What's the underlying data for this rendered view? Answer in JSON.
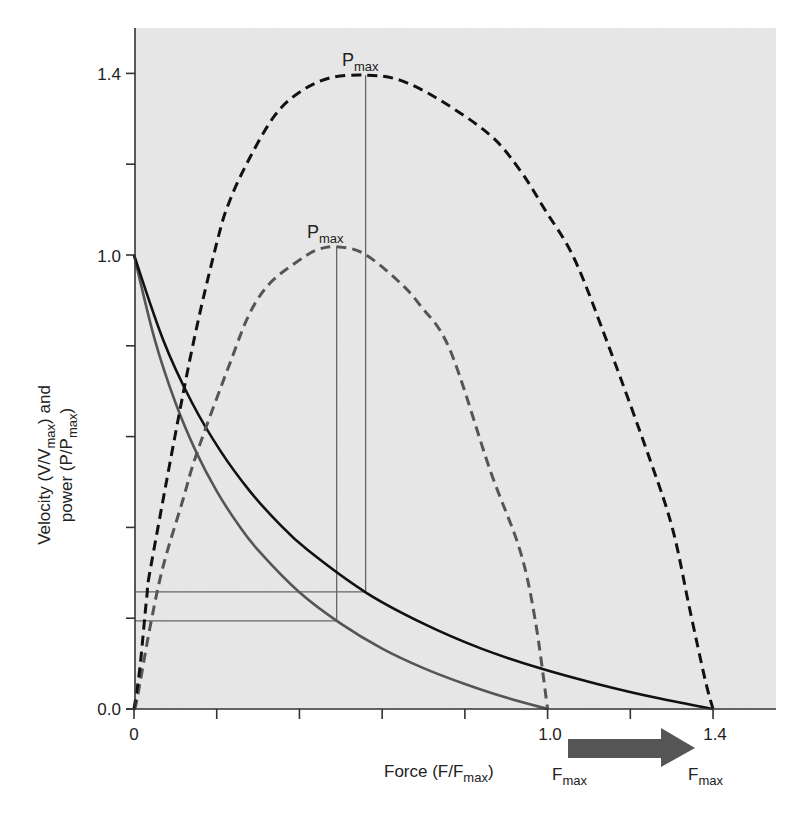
{
  "chart_data": {
    "type": "line",
    "title": "",
    "xlabel": "Force (F/Fmax)",
    "ylabel": "Velocity (V/Vmax) and power (P/Pmax)",
    "xlim": [
      0,
      1.55
    ],
    "ylim": [
      0,
      1.52
    ],
    "grid": false,
    "legend": null,
    "x_ticks": [
      0,
      0.2,
      0.4,
      0.6,
      0.8,
      1.0,
      1.2,
      1.4
    ],
    "x_tick_labels": {
      "0": "0",
      "1.0": "1.0",
      "1.4": "1.4"
    },
    "y_ticks": [
      0,
      0.2,
      0.4,
      0.6,
      0.8,
      1.0,
      1.2,
      1.4
    ],
    "y_tick_labels": {
      "0.0": "0.0",
      "1.0": "1.0",
      "1.4": "1.4"
    },
    "series": [
      {
        "name": "Velocity (Fmax = 1.0)",
        "style": "solid",
        "color": "#555555",
        "x": [
          0,
          0.05,
          0.1,
          0.15,
          0.2,
          0.25,
          0.3,
          0.4,
          0.5,
          0.6,
          0.7,
          0.8,
          0.9,
          1.0
        ],
        "y": [
          1.0,
          0.814,
          0.675,
          0.567,
          0.48,
          0.409,
          0.35,
          0.257,
          0.188,
          0.133,
          0.09,
          0.055,
          0.025,
          0.0
        ]
      },
      {
        "name": "Velocity (Fmax = 1.4)",
        "style": "solid",
        "color": "#111111",
        "x": [
          0,
          0.07,
          0.14,
          0.21,
          0.28,
          0.35,
          0.42,
          0.56,
          0.7,
          0.84,
          0.98,
          1.12,
          1.26,
          1.4
        ],
        "y": [
          1.0,
          0.814,
          0.675,
          0.567,
          0.48,
          0.409,
          0.35,
          0.257,
          0.188,
          0.133,
          0.09,
          0.055,
          0.025,
          0.0
        ]
      },
      {
        "name": "Power (Fmax = 1.0)",
        "style": "dashed",
        "color": "#555555",
        "x": [
          0,
          0.007,
          0.039,
          0.07,
          0.118,
          0.152,
          0.232,
          0.28,
          0.329,
          0.394,
          0.442,
          0.491,
          0.554,
          0.636,
          0.691,
          0.764,
          0.861,
          0.933,
          0.97,
          1.0
        ],
        "y": [
          0,
          0.02,
          0.181,
          0.313,
          0.46,
          0.564,
          0.762,
          0.872,
          0.938,
          0.985,
          1.011,
          1.018,
          1.004,
          0.945,
          0.89,
          0.791,
          0.526,
          0.35,
          0.196,
          0.0
        ]
      },
      {
        "name": "Power (Fmax = 1.4)",
        "style": "dashed",
        "color": "#111111",
        "x": [
          0,
          0.0145,
          0.031,
          0.0435,
          0.135,
          0.2,
          0.232,
          0.28,
          0.341,
          0.401,
          0.474,
          0.563,
          0.643,
          0.74,
          0.861,
          0.933,
          0.994,
          1.066,
          1.151,
          1.248,
          1.303,
          1.344,
          1.381,
          1.4
        ],
        "y": [
          0,
          0.0925,
          0.247,
          0.328,
          0.769,
          1.026,
          1.121,
          1.214,
          1.308,
          1.359,
          1.39,
          1.396,
          1.385,
          1.341,
          1.264,
          1.187,
          1.099,
          0.989,
          0.791,
          0.548,
          0.394,
          0.218,
          0.064,
          0.0
        ]
      }
    ],
    "reference_lines": [
      {
        "name": "Pmax (Fmax = 1.0)",
        "x": 0.49,
        "y_velocity": 0.194,
        "y_power": 1.018,
        "color": "#666666"
      },
      {
        "name": "Pmax (Fmax = 1.4)",
        "x": 0.56,
        "y_velocity": 0.258,
        "y_power": 1.396,
        "color": "#666666"
      }
    ],
    "annotations": [
      {
        "text": "Pmax",
        "x": 0.49,
        "y": 1.018
      },
      {
        "text": "Pmax",
        "x": 0.56,
        "y": 1.396
      },
      {
        "text": "Fmax",
        "x": 1.0,
        "position": "below axis"
      },
      {
        "text": "Fmax",
        "x": 1.4,
        "position": "below axis"
      },
      {
        "text": "arrow",
        "from": 1.0,
        "to": 1.4,
        "position": "below axis",
        "color": "#555555"
      }
    ]
  },
  "labels": {
    "y_tick_0": "0.0",
    "y_tick_1": "1.0",
    "y_tick_14": "1.4",
    "x_tick_0": "0",
    "x_tick_1": "1.0",
    "x_tick_14": "1.4",
    "xlabel_main": "Force (F/F",
    "xlabel_sub": "max",
    "xlabel_end": ")",
    "ylabel_line1_main": "Velocity (V/V",
    "ylabel_line1_sub": "max",
    "ylabel_line1_end": ") and",
    "ylabel_line2_main": "power (P/P",
    "ylabel_line2_sub": "max",
    "ylabel_line2_end": ")",
    "pmax_main": "P",
    "pmax_sub": "max",
    "fmax_main": "F",
    "fmax_sub": "max"
  },
  "colors": {
    "plot_background": "#e8e8e8",
    "axis": "#333333",
    "arrow": "#555555"
  }
}
